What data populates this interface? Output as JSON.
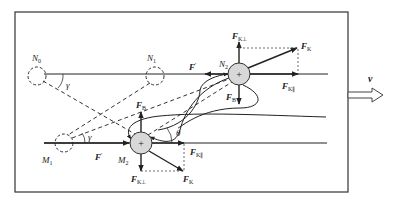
{
  "diagram": {
    "title": "",
    "colors": {
      "stroke": "#222222",
      "circle_fill": "#d8d8d8",
      "dashed": "#333333",
      "frame": "#333333",
      "arrow_fill": "#ffffff"
    },
    "points": {
      "N0": {
        "label": "N",
        "sub": "0"
      },
      "N1": {
        "label": "N",
        "sub": "1"
      },
      "N2": {
        "label": "N",
        "sub": "2"
      },
      "M1": {
        "label": "M",
        "sub": "1"
      },
      "M2": {
        "label": "M",
        "sub": "2"
      }
    },
    "angles": {
      "gamma_top": "γ",
      "gamma_bottom": "γ",
      "theta": "θ"
    },
    "forces": {
      "F_prime_top": {
        "label": "F",
        "sup": "′"
      },
      "F_prime_bottom": {
        "label": "F",
        "sup": "′"
      },
      "F_K_perp_top": {
        "label": "F",
        "sub": "K⊥"
      },
      "F_K_top": {
        "label": "F",
        "sub": "K"
      },
      "F_K_par_top": {
        "label": "F",
        "sub": "K∥"
      },
      "F_B_top": {
        "label": "F",
        "sub": "B"
      },
      "F_B_bottom": {
        "label": "F",
        "sub": "B"
      },
      "F_K_par_bottom": {
        "label": "F",
        "sub": "K∥"
      },
      "F_K_perp_bottom": {
        "label": "F",
        "sub": "K⊥"
      },
      "F_K_bottom": {
        "label": "F",
        "sub": "K"
      }
    },
    "charge_symbol": "+",
    "velocity": {
      "label": "v"
    }
  }
}
